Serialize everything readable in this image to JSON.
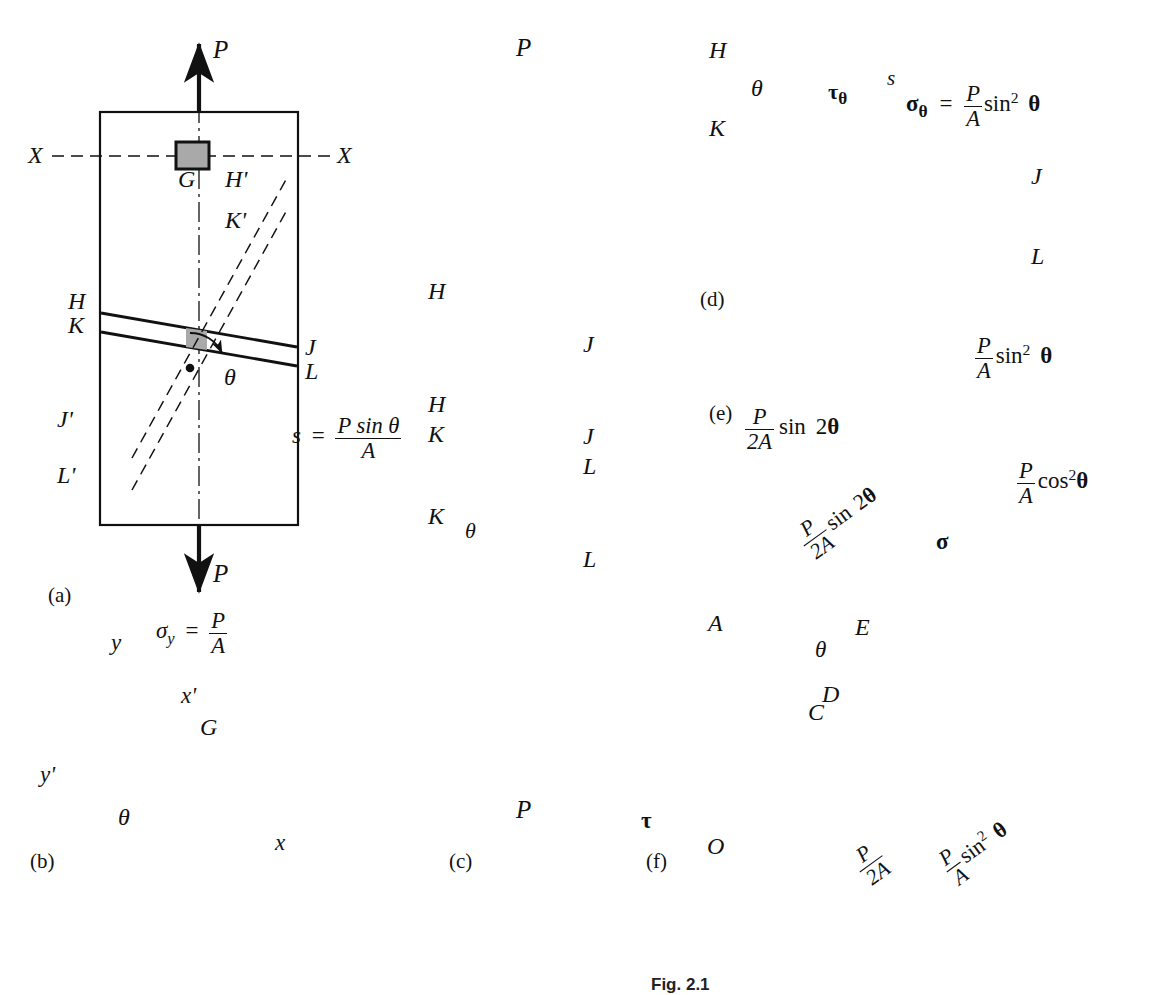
{
  "figure": {
    "caption": "Fig. 2.1",
    "panels": [
      {
        "id": "a",
        "label": "(a)",
        "x": 48,
        "y": 583
      },
      {
        "id": "b",
        "label": "(b)",
        "x": 30,
        "y": 849
      },
      {
        "id": "c",
        "label": "(c)",
        "x": 449,
        "y": 849
      },
      {
        "id": "d",
        "label": "(d)",
        "x": 700,
        "y": 287
      },
      {
        "id": "e",
        "label": "(e)",
        "x": 709,
        "y": 401
      },
      {
        "id": "f",
        "label": "(f)",
        "x": 646,
        "y": 849
      }
    ]
  },
  "panel_a": {
    "force_top": "P",
    "force_bottom": "P",
    "section_line_left": "X",
    "section_line_right": "X",
    "element": "G",
    "plane_labels": [
      "H",
      "K",
      "J",
      "L"
    ],
    "alt_plane_labels": [
      "H'",
      "K'",
      "J'",
      "L'"
    ],
    "angle": "θ"
  },
  "panel_b": {
    "axis_y": "y",
    "axis_x": "x",
    "axis_yp": "y'",
    "axis_xp": "x'",
    "element": "G",
    "angle": "θ",
    "stress_sym": "σ",
    "stress_sub": "y",
    "stress_eq": "=",
    "stress_num": "P",
    "stress_den": "A"
  },
  "panel_c": {
    "force_top": "P",
    "force_bottom": "P",
    "labels_block1": [
      "H",
      "J"
    ],
    "labels_block2": [
      "H",
      "K",
      "J",
      "L"
    ],
    "labels_block3": [
      "K",
      "L"
    ],
    "angle": "θ",
    "s_symbol": "s",
    "s_eq": "=",
    "s_num": "P sin θ",
    "s_den": "A"
  },
  "panel_d": {
    "corner_labels": [
      "H",
      "K",
      "J",
      "L"
    ],
    "angle": "θ",
    "tau_label": "τ",
    "tau_sub": "θ",
    "s_label": "s",
    "sigma_label": "σ",
    "sigma_sub": "θ",
    "eq": "=",
    "num": "P",
    "den": "A",
    "trig": "sin",
    "exp": "2",
    "angle_var": "θ"
  },
  "panel_e": {
    "normal_stress": {
      "num": "P",
      "den": "A",
      "trig": "sin",
      "exp": "2",
      "angle": "θ"
    },
    "shear_stress": {
      "num": "P",
      "den": "2A",
      "trig": "sin",
      "factor": "2",
      "angle": "θ"
    },
    "axial_stress": {
      "num": "P",
      "den": "A",
      "trig": "cos",
      "exp": "2",
      "angle": "θ"
    }
  },
  "panel_f": {
    "points": [
      "A",
      "E",
      "D",
      "C",
      "O"
    ],
    "axis_sigma": "σ",
    "axis_tau": "τ",
    "angle": "θ",
    "dim_shear": {
      "num": "P",
      "den": "2A",
      "trig": "sin",
      "factor": "2",
      "angle": "θ"
    },
    "dim_radius": {
      "num": "P",
      "den": "2A"
    },
    "dim_normal": {
      "num": "P",
      "den": "A",
      "trig": "sin",
      "exp": "2",
      "angle": "θ"
    }
  },
  "colors": {
    "ink": "#111111",
    "element_fill": "#a9a9a9",
    "element_fill_light": "#b4b4b4",
    "background": "#ffffff"
  }
}
